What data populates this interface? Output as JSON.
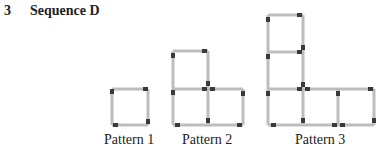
{
  "question": {
    "number": "3",
    "title": "Sequence D"
  },
  "patterns": [
    {
      "label": "Pattern 1",
      "squares": 1
    },
    {
      "label": "Pattern 2",
      "squares": 3
    },
    {
      "label": "Pattern 3",
      "squares": 5
    }
  ],
  "colors": {
    "stick": "#bdbdbd",
    "head": "#3a3a3a"
  }
}
